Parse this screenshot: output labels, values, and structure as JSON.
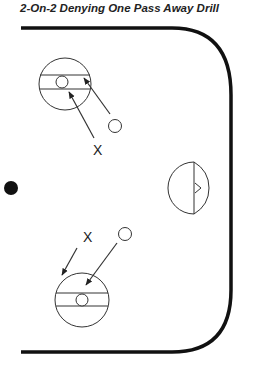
{
  "title": "2-On-2 Denying One Pass Away Drill",
  "labels": {
    "defender_top": "X",
    "defender_bottom": "X"
  },
  "colors": {
    "ink": "#222222",
    "boundary": "#111111"
  },
  "elements": [
    {
      "type": "rink-boundary"
    },
    {
      "type": "puck-dot"
    },
    {
      "type": "faceoff-circle",
      "position": "top-left"
    },
    {
      "type": "faceoff-circle",
      "position": "bottom-left"
    },
    {
      "type": "net",
      "position": "right"
    },
    {
      "type": "offensive-player",
      "symbol": "O",
      "count": 2
    },
    {
      "type": "defensive-player",
      "symbol": "X",
      "count": 2
    }
  ]
}
